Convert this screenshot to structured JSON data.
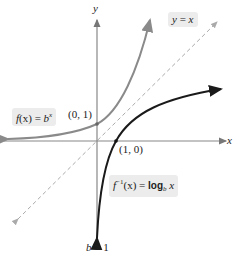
{
  "diagram": {
    "axes": {
      "x_label": "x",
      "y_label": "y"
    },
    "condition": {
      "b": "b",
      "op": " > ",
      "val": "1"
    },
    "identity_line": {
      "label_lhs": "y",
      "label_eq": " = ",
      "label_rhs": "x",
      "style": "dashed"
    },
    "exponential": {
      "label_f": "f",
      "label_arg": "(x)",
      "label_eq": " = ",
      "label_base": "b",
      "label_exp": "x",
      "point_label": "(0, 1)",
      "color": "#8a8a8a"
    },
    "logarithm": {
      "label_f": "f",
      "label_inv": "−1",
      "label_arg": "(x)",
      "label_eq": " = ",
      "label_log": "log",
      "label_base": "b",
      "label_var": " x",
      "point_label": "(1, 0)",
      "color": "#1a1a1a"
    },
    "colors": {
      "axis": "#888888",
      "identity": "#aaaaaa",
      "label_box": "#ececec"
    }
  }
}
